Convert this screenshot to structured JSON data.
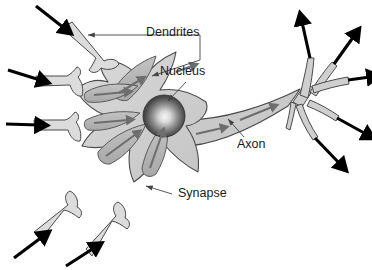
{
  "figure": {
    "type": "biological-schematic",
    "background_color": "#ffffff",
    "width": 372,
    "height": 270
  },
  "labels": [
    {
      "id": "dendrites",
      "text": "Dendrites",
      "x": 146,
      "y": 33,
      "leader": "bracket-two-arrowheads",
      "points_to": [
        "upper-left dendrite shaft",
        "upper dendrite lobe"
      ]
    },
    {
      "id": "nucleus",
      "text": "Nucleus",
      "x": 160,
      "y": 72,
      "leader": "single-arrow-down-left",
      "points_to": [
        "nucleus sphere"
      ]
    },
    {
      "id": "axon",
      "text": "Axon",
      "x": 237,
      "y": 145,
      "leader": "single-arrow-up-left",
      "points_to": [
        "axon shaft"
      ]
    },
    {
      "id": "synapse",
      "text": "Synapse",
      "x": 178,
      "y": 194,
      "leader": "single-arrow-left",
      "points_to": [
        "lower dendrite tip"
      ]
    }
  ],
  "colors": {
    "soma_fill": "#d2d2d2",
    "dendrite_fill": "#b6b6b6",
    "axon_fill": "#c9c9c9",
    "terminal_fill": "#cfcfcf",
    "synapse_fill": "#dcdcdc",
    "nucleus_dark": "#3a3a3a",
    "nucleus_highlight": "#f2f2f2",
    "outline": "#4a4a4a",
    "flow_arrow": "#6e6e6e",
    "io_arrow": "#000000",
    "leader": "#444444",
    "text": "#1a1a1a"
  },
  "structures": {
    "soma": {
      "name": "cell body",
      "shape": "star-shaped",
      "dendrite_count": 5
    },
    "nucleus": {
      "name": "nucleus",
      "shape": "shaded sphere",
      "cx": 164,
      "cy": 116,
      "r": 21
    },
    "axon": {
      "name": "axon",
      "direction": "right and upward",
      "internal_arrows": 2
    },
    "axon_terminals": {
      "count": 5,
      "output_arrows": 5
    },
    "input_arrows": {
      "count": 5,
      "description": "black arrows entering synaptic terminals"
    },
    "flow_arrows": {
      "count": 7,
      "description": "gray arrows showing signal direction toward soma and along axon"
    }
  }
}
